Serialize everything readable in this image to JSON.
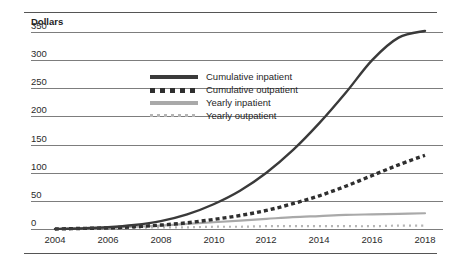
{
  "chart_data": {
    "type": "line",
    "title": "",
    "ylabel": "Dollars",
    "xlabel": "",
    "x": [
      2004,
      2005,
      2006,
      2007,
      2008,
      2009,
      2010,
      2011,
      2012,
      2013,
      2014,
      2015,
      2016,
      2017,
      2018
    ],
    "ylim": [
      0,
      350
    ],
    "xlim": [
      2004,
      2018
    ],
    "grid": true,
    "legend_position": "upper-center",
    "yticks": [
      "0",
      "50",
      "100",
      "150",
      "200",
      "250",
      "300",
      "350"
    ],
    "ytick_values": [
      0,
      50,
      100,
      150,
      200,
      250,
      300,
      350
    ],
    "xticks": [
      "2004",
      "2006",
      "2008",
      "2010",
      "2012",
      "2014",
      "2016",
      "2018"
    ],
    "xtick_values": [
      2004,
      2006,
      2008,
      2010,
      2012,
      2014,
      2016,
      2018
    ],
    "series": [
      {
        "name": "Cumulative inpatient",
        "style": "solid-dark",
        "color": "#3a3a3a",
        "values": [
          0,
          1,
          3,
          7,
          14,
          26,
          44,
          68,
          100,
          140,
          188,
          242,
          300,
          340,
          352
        ]
      },
      {
        "name": "Cumulative outpatient",
        "style": "dashed-dark",
        "color": "#2f2f2f",
        "values": [
          0,
          1,
          2,
          4,
          7,
          11,
          17,
          24,
          33,
          45,
          59,
          76,
          95,
          114,
          131
        ]
      },
      {
        "name": "Yearly inpatient",
        "style": "solid-gray",
        "color": "#a9a9a9",
        "values": [
          0,
          1,
          2,
          4,
          6,
          9,
          12,
          15,
          18,
          21,
          23,
          25,
          26,
          27,
          28
        ]
      },
      {
        "name": "Yearly outpatient",
        "style": "dotted-gray",
        "color": "#b5b5b5",
        "values": [
          0,
          1,
          1,
          2,
          3,
          3,
          4,
          4,
          5,
          5,
          5,
          5,
          5,
          6,
          6
        ]
      }
    ]
  },
  "legend": {
    "items": [
      {
        "label": "Cumulative inpatient"
      },
      {
        "label": "Cumulative outpatient"
      },
      {
        "label": "Yearly inpatient"
      },
      {
        "label": "Yearly outpatient"
      }
    ]
  }
}
